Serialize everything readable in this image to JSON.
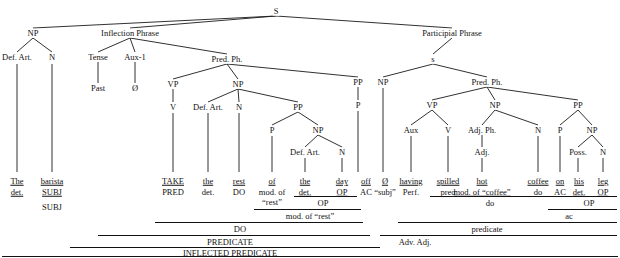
{
  "diagram": {
    "line_color": "#1a1a1a",
    "text_color": "#111111",
    "background": "#ffffff"
  },
  "nodes": [
    {
      "id": "S",
      "label": "S",
      "x": 276,
      "y": 11
    },
    {
      "id": "NP1",
      "label": "NP",
      "x": 33,
      "y": 33
    },
    {
      "id": "IP",
      "label": "Inflection Phrase",
      "x": 130,
      "y": 33
    },
    {
      "id": "PartPh",
      "label": "Participial Phrase",
      "x": 452,
      "y": 33
    },
    {
      "id": "DefArt1",
      "label": "Def. Art.",
      "x": 17,
      "y": 57
    },
    {
      "id": "N1",
      "label": "N",
      "x": 52,
      "y": 57
    },
    {
      "id": "Tense",
      "label": "Tense",
      "x": 98,
      "y": 57
    },
    {
      "id": "Aux1",
      "label": "Aux-1",
      "x": 135,
      "y": 57
    },
    {
      "id": "PredPh1",
      "label": "Pred. Ph.",
      "x": 227,
      "y": 59
    },
    {
      "id": "s2",
      "label": "s",
      "x": 433,
      "y": 59
    },
    {
      "id": "Past",
      "label": "Past",
      "x": 98,
      "y": 88
    },
    {
      "id": "Zero1",
      "label": "Ø",
      "x": 135,
      "y": 88
    },
    {
      "id": "VP1",
      "label": "VP",
      "x": 173,
      "y": 84
    },
    {
      "id": "NP2",
      "label": "NP",
      "x": 238,
      "y": 84
    },
    {
      "id": "PP3",
      "label": "PP",
      "x": 358,
      "y": 82
    },
    {
      "id": "NP5",
      "label": "NP",
      "x": 383,
      "y": 82
    },
    {
      "id": "PredPh2",
      "label": "Pred. Ph.",
      "x": 487,
      "y": 82
    },
    {
      "id": "V1",
      "label": "V",
      "x": 173,
      "y": 107
    },
    {
      "id": "DefArt2",
      "label": "Def. Art.",
      "x": 208,
      "y": 107
    },
    {
      "id": "N2",
      "label": "N",
      "x": 239,
      "y": 107
    },
    {
      "id": "PP1",
      "label": "PP",
      "x": 298,
      "y": 107
    },
    {
      "id": "P3",
      "label": "P",
      "x": 358,
      "y": 105
    },
    {
      "id": "VP2",
      "label": "VP",
      "x": 432,
      "y": 105
    },
    {
      "id": "NP6",
      "label": "NP",
      "x": 495,
      "y": 105
    },
    {
      "id": "PP4",
      "label": "PP",
      "x": 578,
      "y": 105
    },
    {
      "id": "P1",
      "label": "P",
      "x": 272,
      "y": 130
    },
    {
      "id": "NP3",
      "label": "NP",
      "x": 318,
      "y": 130
    },
    {
      "id": "Aux2",
      "label": "Aux",
      "x": 411,
      "y": 130
    },
    {
      "id": "V2",
      "label": "V",
      "x": 448,
      "y": 130
    },
    {
      "id": "AdjPh",
      "label": "Adj. Ph.",
      "x": 482,
      "y": 130
    },
    {
      "id": "N4",
      "label": "N",
      "x": 538,
      "y": 130
    },
    {
      "id": "P4",
      "label": "P",
      "x": 560,
      "y": 130
    },
    {
      "id": "NP7",
      "label": "NP",
      "x": 592,
      "y": 130
    },
    {
      "id": "DefArt3",
      "label": "Def. Art.",
      "x": 305,
      "y": 152
    },
    {
      "id": "N3",
      "label": "N",
      "x": 342,
      "y": 152
    },
    {
      "id": "Adj",
      "label": "Adj.",
      "x": 482,
      "y": 152
    },
    {
      "id": "Poss",
      "label": "Poss.",
      "x": 578,
      "y": 152
    },
    {
      "id": "N5",
      "label": "N",
      "x": 603,
      "y": 152
    }
  ],
  "edges": [
    {
      "from": "S",
      "to": "NP1"
    },
    {
      "from": "S",
      "to": "IP"
    },
    {
      "from": "S",
      "to": "PartPh"
    },
    {
      "from": "NP1",
      "to": "DefArt1"
    },
    {
      "from": "NP1",
      "to": "N1"
    },
    {
      "from": "IP",
      "to": "Tense"
    },
    {
      "from": "IP",
      "to": "Aux1"
    },
    {
      "from": "IP",
      "to": "PredPh1"
    },
    {
      "from": "Tense",
      "to": "Past"
    },
    {
      "from": "Aux1",
      "to": "Zero1"
    },
    {
      "from": "PredPh1",
      "to": "VP1"
    },
    {
      "from": "PredPh1",
      "to": "NP2"
    },
    {
      "from": "PredPh1",
      "to": "PP3"
    },
    {
      "from": "VP1",
      "to": "V1"
    },
    {
      "from": "NP2",
      "to": "DefArt2"
    },
    {
      "from": "NP2",
      "to": "N2"
    },
    {
      "from": "NP2",
      "to": "PP1"
    },
    {
      "from": "PP1",
      "to": "P1"
    },
    {
      "from": "PP1",
      "to": "NP3"
    },
    {
      "from": "NP3",
      "to": "DefArt3"
    },
    {
      "from": "NP3",
      "to": "N3"
    },
    {
      "from": "PP3",
      "to": "P3"
    },
    {
      "from": "PartPh",
      "to": "s2"
    },
    {
      "from": "s2",
      "to": "NP5"
    },
    {
      "from": "s2",
      "to": "PredPh2"
    },
    {
      "from": "PredPh2",
      "to": "VP2"
    },
    {
      "from": "PredPh2",
      "to": "NP6"
    },
    {
      "from": "PredPh2",
      "to": "PP4"
    },
    {
      "from": "VP2",
      "to": "Aux2"
    },
    {
      "from": "VP2",
      "to": "V2"
    },
    {
      "from": "NP6",
      "to": "AdjPh"
    },
    {
      "from": "NP6",
      "to": "N4"
    },
    {
      "from": "AdjPh",
      "to": "Adj"
    },
    {
      "from": "PP4",
      "to": "P4"
    },
    {
      "from": "PP4",
      "to": "NP7"
    },
    {
      "from": "NP7",
      "to": "Poss"
    },
    {
      "from": "NP7",
      "to": "N5"
    }
  ],
  "leaf_stems": [
    {
      "node": "DefArt1",
      "x": 17,
      "top": 64,
      "bottom": 172
    },
    {
      "node": "N1",
      "x": 52,
      "top": 64,
      "bottom": 172
    },
    {
      "node": "V1",
      "x": 173,
      "top": 113,
      "bottom": 172
    },
    {
      "node": "DefArt2",
      "x": 208,
      "top": 113,
      "bottom": 172
    },
    {
      "node": "N2",
      "x": 239,
      "top": 113,
      "bottom": 172
    },
    {
      "node": "P1",
      "x": 272,
      "top": 136,
      "bottom": 172
    },
    {
      "node": "DefArt3",
      "x": 305,
      "top": 158,
      "bottom": 172
    },
    {
      "node": "N3",
      "x": 342,
      "top": 158,
      "bottom": 172
    },
    {
      "node": "P3",
      "x": 358,
      "top": 111,
      "bottom": 172
    },
    {
      "node": "NP5",
      "x": 383,
      "top": 88,
      "bottom": 172
    },
    {
      "node": "Aux2",
      "x": 411,
      "top": 136,
      "bottom": 172
    },
    {
      "node": "V2",
      "x": 448,
      "top": 136,
      "bottom": 172
    },
    {
      "node": "Adj",
      "x": 482,
      "top": 158,
      "bottom": 172
    },
    {
      "node": "N4",
      "x": 538,
      "top": 136,
      "bottom": 172
    },
    {
      "node": "P4",
      "x": 560,
      "top": 136,
      "bottom": 172
    },
    {
      "node": "Poss",
      "x": 578,
      "top": 158,
      "bottom": 172
    },
    {
      "node": "N5",
      "x": 603,
      "top": 158,
      "bottom": 172
    }
  ],
  "words": [
    {
      "text": "The",
      "x": 17,
      "y": 181,
      "func": "det.",
      "func_underline": true
    },
    {
      "text": "barista",
      "x": 52,
      "y": 181,
      "func": "SUBJ",
      "func_underline": true
    },
    {
      "text": "TAKE",
      "x": 173,
      "y": 181,
      "func": "PRED",
      "func_underline": false
    },
    {
      "text": "the",
      "x": 208,
      "y": 181,
      "func": "det.",
      "func_underline": false
    },
    {
      "text": "rest",
      "x": 239,
      "y": 181,
      "func": "DO",
      "func_underline": false
    },
    {
      "text": "of",
      "x": 272,
      "y": 181,
      "func": "mod. of",
      "func_underline": false
    },
    {
      "text": "the",
      "x": 305,
      "y": 181,
      "func": "det.",
      "func_underline": true
    },
    {
      "text": "day",
      "x": 342,
      "y": 181,
      "func": "OP",
      "func_underline": true
    },
    {
      "text": "off",
      "x": 366,
      "y": 181,
      "func": "AC",
      "func_underline": false
    },
    {
      "text": "Ø",
      "x": 385,
      "y": 181,
      "func": "“subj”",
      "func_underline": false
    },
    {
      "text": "having",
      "x": 411,
      "y": 181,
      "func": "Perf.",
      "func_underline": false
    },
    {
      "text": "spilled",
      "x": 448,
      "y": 181,
      "func": "pred",
      "func_underline": false
    },
    {
      "text": "hot",
      "x": 482,
      "y": 181,
      "func": "mod. of “coffee”",
      "func_underline": true
    },
    {
      "text": "coffee",
      "x": 538,
      "y": 181,
      "func": "do",
      "func_underline": false
    },
    {
      "text": "on",
      "x": 560,
      "y": 181,
      "func": "AC",
      "func_underline": false
    },
    {
      "text": "his",
      "x": 579,
      "y": 181,
      "func": "det.",
      "func_underline": true
    },
    {
      "text": "leg",
      "x": 603,
      "y": 181,
      "func": "OP",
      "func_underline": true
    }
  ],
  "extra_func_lines": [
    {
      "text": "“rest”",
      "x": 272,
      "y": 202
    }
  ],
  "brackets": [
    {
      "label": "SUBJ",
      "x": 52,
      "y": 203,
      "x1": 8,
      "x2": 72,
      "rule_y": 196,
      "show_rule": false
    },
    {
      "label": "OP",
      "x": 323,
      "y": 199,
      "x1": 294,
      "x2": 357,
      "rule_y": 196,
      "show_rule": true
    },
    {
      "label": "do",
      "x": 490,
      "y": 199,
      "x1": 430,
      "x2": 570,
      "rule_y": 196,
      "show_rule": true
    },
    {
      "label": "OP",
      "x": 589,
      "y": 199,
      "x1": 568,
      "x2": 617,
      "rule_y": 196,
      "show_rule": true
    },
    {
      "label": "mod. of “rest”",
      "x": 310,
      "y": 212,
      "x1": 254,
      "x2": 361,
      "rule_y": 209,
      "show_rule": true
    },
    {
      "label": "ac",
      "x": 569,
      "y": 212,
      "x1": 548,
      "x2": 617,
      "rule_y": 209,
      "show_rule": true
    },
    {
      "label": "DO",
      "x": 240,
      "y": 225,
      "x1": 155,
      "x2": 363,
      "rule_y": 222,
      "show_rule": true
    },
    {
      "label": "predicate",
      "x": 487,
      "y": 225,
      "x1": 398,
      "x2": 617,
      "rule_y": 222,
      "show_rule": true
    },
    {
      "label": "PREDICATE",
      "x": 230,
      "y": 238,
      "x1": 98,
      "x2": 370,
      "rule_y": 235,
      "show_rule": true
    },
    {
      "label": "Adv. Adj.",
      "x": 415,
      "y": 238,
      "x1": 380,
      "x2": 617,
      "rule_y": 235,
      "show_rule": true
    },
    {
      "label": "INFLECTED PREDICATE",
      "x": 230,
      "y": 249,
      "x1": 70,
      "x2": 380,
      "rule_y": 247,
      "show_rule": true
    }
  ],
  "baseline_rule": {
    "x1": 2,
    "x2": 618,
    "y": 256
  }
}
